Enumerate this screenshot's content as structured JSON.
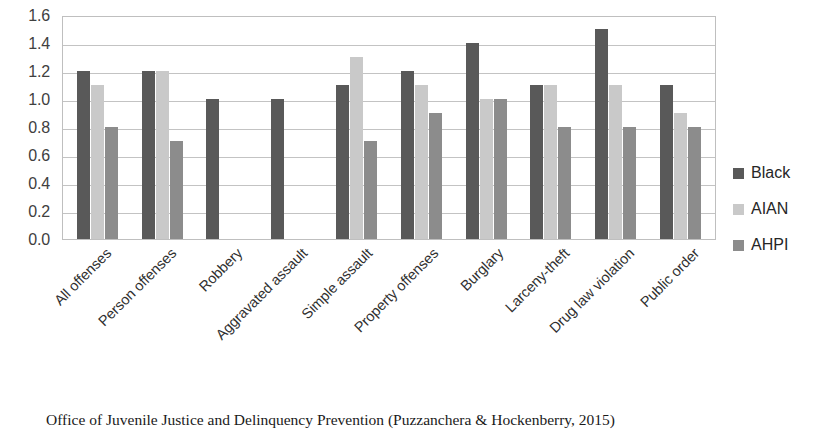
{
  "chart_data": {
    "type": "bar",
    "title": "",
    "subtitle": "",
    "xlabel": "",
    "ylabel": "",
    "ylim": [
      0.0,
      1.6
    ],
    "ytick_step": 0.2,
    "ytick_labels": [
      "1.6",
      "1.4",
      "1.2",
      "1.0",
      "0.8",
      "0.6",
      "0.4",
      "0.2",
      "0.0"
    ],
    "ytick_values": [
      1.6,
      1.4,
      1.2,
      1.0,
      0.8,
      0.6,
      0.4,
      0.2,
      0.0
    ],
    "grid": true,
    "grid_axis": "y",
    "legend_position": "right",
    "categories": [
      "All offenses",
      "Person offenses",
      "Robbery",
      "Aggravated assault",
      "Simple assault",
      "Property offenses",
      "Burglary",
      "Larceny-theft",
      "Drug law violation",
      "Public order"
    ],
    "series": [
      {
        "name": "Black",
        "color": "#595959",
        "values": [
          1.2,
          1.2,
          1.0,
          1.0,
          1.1,
          1.2,
          1.4,
          1.1,
          1.5,
          1.1
        ]
      },
      {
        "name": "AIAN",
        "color": "#c9c9c9",
        "values": [
          1.1,
          1.2,
          null,
          null,
          1.3,
          1.1,
          1.0,
          1.1,
          1.1,
          0.9
        ]
      },
      {
        "name": "AHPI",
        "color": "#8c8c8c",
        "values": [
          0.8,
          0.7,
          null,
          null,
          0.7,
          0.9,
          1.0,
          0.8,
          0.8,
          0.8
        ]
      }
    ]
  },
  "legend": {
    "items": [
      {
        "label": "Black"
      },
      {
        "label": "AIAN"
      },
      {
        "label": "AHPI"
      }
    ]
  },
  "caption": {
    "text": "Office of Juvenile Justice and Delinquency Prevention (Puzzanchera & Hockenberry, 2015)"
  }
}
